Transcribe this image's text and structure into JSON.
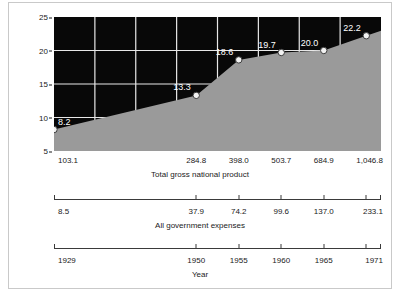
{
  "chart_data": {
    "type": "area",
    "title": "",
    "ylabel": "Percent government spends of total gross national product",
    "ylabel_lines": [
      "Percent government spends of total",
      "gross national product"
    ],
    "ylim": [
      5,
      25
    ],
    "yticks": [
      25,
      20,
      15,
      10,
      5
    ],
    "grid": true,
    "legend": false,
    "series": [
      {
        "name": "Percent government spends of total gross national product",
        "values": [
          8.2,
          13.3,
          18.6,
          19.7,
          20.0,
          22.2
        ],
        "point_labels": [
          "8.2",
          "13.3",
          "18.6",
          "19.7",
          "20.0",
          "22.2"
        ]
      }
    ],
    "x_positions_fraction": [
      0.0,
      0.435,
      0.565,
      0.695,
      0.825,
      0.955
    ],
    "axes": [
      {
        "name": "gnp-axis",
        "caption": "Total gross national product",
        "ticks": [
          "103.1",
          "284.8",
          "398.0",
          "503.7",
          "684.9",
          "1,046.8"
        ]
      },
      {
        "name": "expenses-axis",
        "caption": "All government expenses",
        "ticks": [
          "8.5",
          "37.9",
          "74.2",
          "99.6",
          "137.0",
          "233.1"
        ]
      },
      {
        "name": "year-axis",
        "caption": "Year",
        "ticks": [
          "1929",
          "1950",
          "1955",
          "1960",
          "1965",
          "1971"
        ]
      }
    ],
    "colors": {
      "plot_background": "#080808",
      "area_fill": "#9a9a9a",
      "gridline": "#e8e8e8",
      "marker_fill": "#f2f2f2",
      "marker_stroke": "#3c3c3c",
      "label_text": "#ffffff",
      "axis_text": "#1a1a1a",
      "frame": "#c9c9c9"
    }
  }
}
